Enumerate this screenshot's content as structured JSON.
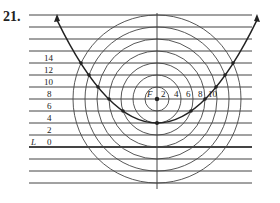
{
  "problem_number": "21.",
  "focus_label": "F",
  "directrix_label": "L",
  "directrix_value": "0",
  "y_labels": [
    "14",
    "12",
    "10",
    "8",
    "6",
    "4",
    "2"
  ],
  "radius_labels": [
    "2",
    "4",
    "6",
    "8",
    "10"
  ],
  "colors": {
    "line": "#333333",
    "background": "#ffffff"
  }
}
